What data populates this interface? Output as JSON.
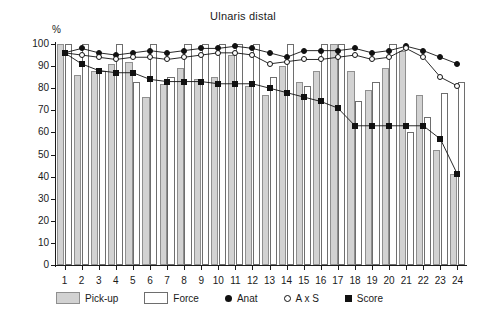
{
  "chart_data": {
    "type": "bar",
    "title": "Ulnaris distal",
    "xlabel": "",
    "ylabel": "%",
    "ylim": [
      0,
      100
    ],
    "ytick_labels": [
      "0",
      "10",
      "20",
      "30",
      "40",
      "50",
      "60",
      "70",
      "80",
      "90",
      "100"
    ],
    "yticks": [
      0,
      10,
      20,
      30,
      40,
      50,
      60,
      70,
      80,
      90,
      100
    ],
    "grid": false,
    "legend_position": "bottom",
    "categories": [
      "1",
      "2",
      "3",
      "4",
      "5",
      "6",
      "7",
      "8",
      "9",
      "10",
      "11",
      "12",
      "13",
      "14",
      "15",
      "16",
      "17",
      "18",
      "19",
      "20",
      "21",
      "22",
      "23",
      "24"
    ],
    "series": [
      {
        "name": "Pick-up",
        "kind": "bar",
        "color": "#d2d2d2",
        "values": [
          100,
          86,
          88,
          91,
          92,
          76,
          82,
          89,
          84,
          85,
          95,
          81,
          77,
          90,
          83,
          88,
          100,
          88,
          79,
          89,
          97,
          77,
          52,
          41
        ]
      },
      {
        "name": "Force",
        "kind": "bar",
        "color": "#ffffff",
        "values": [
          100,
          100,
          88,
          100,
          83,
          100,
          85,
          100,
          100,
          100,
          100,
          100,
          85,
          100,
          81,
          100,
          100,
          74,
          83,
          100,
          60,
          67,
          78,
          83
        ]
      },
      {
        "name": "Anat",
        "kind": "line",
        "marker": "filled-circle",
        "color": "#111111",
        "values": [
          96,
          98,
          96,
          95,
          96,
          97,
          96,
          97,
          98,
          98,
          99,
          98,
          96,
          94,
          97,
          97,
          97,
          98,
          96,
          97,
          99,
          97,
          94,
          91
        ]
      },
      {
        "name": "A x S",
        "kind": "line",
        "marker": "open-circle",
        "color": "#111111",
        "values": [
          96,
          95,
          94,
          93,
          94,
          94,
          93,
          94,
          95,
          96,
          96,
          95,
          91,
          92,
          93,
          93,
          94,
          95,
          93,
          94,
          98,
          94,
          85,
          81
        ]
      },
      {
        "name": "Score",
        "kind": "line",
        "marker": "filled-square",
        "color": "#111111",
        "values": [
          96,
          91,
          88,
          87,
          87,
          84,
          83,
          83,
          83,
          82,
          82,
          82,
          80,
          78,
          76,
          74,
          71,
          63,
          63,
          63,
          63,
          63,
          57,
          41
        ]
      }
    ]
  },
  "legend": {
    "items": [
      {
        "label": "Pick-up",
        "swatch": "pickup-swatch"
      },
      {
        "label": "Force",
        "swatch": "force-swatch"
      },
      {
        "label": "Anat",
        "swatch": "anat-marker"
      },
      {
        "label": "A x S",
        "swatch": "axs-marker"
      },
      {
        "label": "Score",
        "swatch": "score-marker"
      }
    ]
  }
}
